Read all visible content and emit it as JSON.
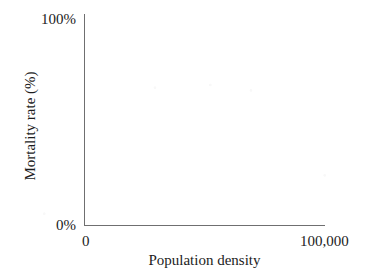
{
  "chart_data": {
    "type": "line",
    "title": "",
    "subtitle": "",
    "xlabel": "Population density",
    "ylabel": "Mortality rate (%)",
    "x_tick_labels": [
      "0",
      "100,000"
    ],
    "y_tick_labels": [
      "0%",
      "100%"
    ],
    "xlim": [
      0,
      100000
    ],
    "ylim": [
      0,
      100
    ],
    "grid": false,
    "legend": null,
    "series": [],
    "annotations": [],
    "note": "Blank axes template — no data series are plotted in the figure.",
    "axis_color": "#6f6f70",
    "text_color": "#1c1c1c",
    "background": "#ffffff"
  },
  "figure": {
    "y_axis": {
      "title": "Mortality rate (%)",
      "tick_top": "100%",
      "tick_bottom": "0%"
    },
    "x_axis": {
      "title": "Population density",
      "tick_left": "0",
      "tick_right": "100,000"
    }
  }
}
